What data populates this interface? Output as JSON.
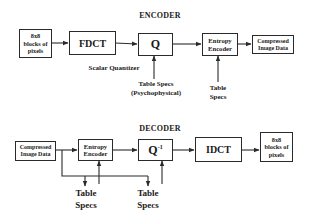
{
  "encoder": {
    "title": "ENCODER",
    "blocks_input": {
      "line1": "8x8",
      "line2": "blocks of",
      "line3": "pixels"
    },
    "fdct": "FDCT",
    "quantizer": "Q",
    "quantizer_label": "Scalar Quantizer",
    "quant_table": {
      "line1": "Table Specs",
      "line2": "(Psychophysical)"
    },
    "entropy": {
      "line1": "Entropy",
      "line2": "Encoder"
    },
    "entropy_table": {
      "line1": "Table",
      "line2": "Specs"
    },
    "output": {
      "line1": "Compressed",
      "line2": "Image Data"
    }
  },
  "decoder": {
    "title": "DECODER",
    "input": {
      "line1": "Compressed",
      "line2": "Image Data"
    },
    "entropy": {
      "line1": "Entropy",
      "line2": "Encoder"
    },
    "dequantizer": "Q",
    "dequantizer_sup": "-1",
    "idct": "IDCT",
    "blocks_output": {
      "line1": "8x8",
      "line2": "blocks of",
      "line3": "pixels"
    },
    "entropy_table": {
      "line1": "Table",
      "line2": "Specs"
    },
    "quant_table": {
      "line1": "Table",
      "line2": "Specs"
    }
  },
  "colors": {
    "stroke": "#2a2a2a",
    "background": "#ffffff"
  }
}
